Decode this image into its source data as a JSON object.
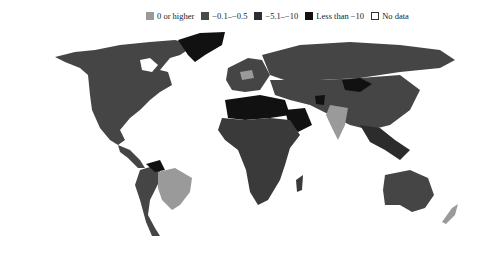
{
  "legend": {
    "items": [
      {
        "label": "0 or higher",
        "color": "#9a9a9a"
      },
      {
        "label": "−0.1–−0.5",
        "color": "#4a4a4a"
      },
      {
        "label": "−5.1–−10",
        "color": "#2e2e2e"
      },
      {
        "label": "Less than −10",
        "color": "#111111"
      },
      {
        "label": "No data",
        "color": "#ffffff"
      }
    ]
  },
  "colors": {
    "higher": "#9a9a9a",
    "mid": "#454545",
    "dark": "#2c2c2c",
    "darkest": "#111111",
    "nodata": "#ffffff"
  }
}
